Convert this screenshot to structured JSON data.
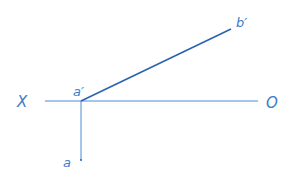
{
  "diagram": {
    "type": "descriptive-geometry-projection",
    "colors": {
      "axis": "#4a8bd4",
      "segment": "#2b63b0",
      "label": "#3a7dc9"
    },
    "axis": {
      "left_label": "X",
      "right_label": "O"
    },
    "points": {
      "a_prime": {
        "label": "a′"
      },
      "b_prime": {
        "label": "b′"
      },
      "a": {
        "label": "a"
      }
    }
  }
}
